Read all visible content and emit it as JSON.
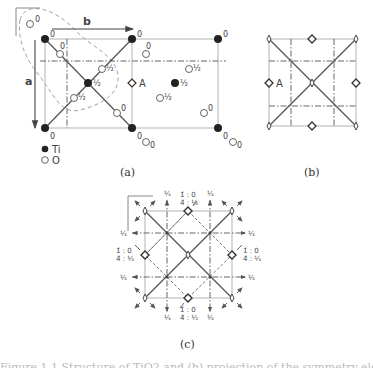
{
  "figure": {
    "panel_a": {
      "caption": "(a)",
      "axis_a_label": "a",
      "axis_b_label": "b",
      "symmetry_label": "A",
      "legend": [
        {
          "symbol": "filled-circle",
          "label": "Ti"
        },
        {
          "symbol": "open-circle",
          "label": "O"
        }
      ],
      "ti_atoms": [
        {
          "x": 45,
          "y": 39,
          "h": "0"
        },
        {
          "x": 132,
          "y": 39,
          "h": "0"
        },
        {
          "x": 218,
          "y": 39,
          "h": "0"
        },
        {
          "x": 45,
          "y": 128,
          "h": "0"
        },
        {
          "x": 132,
          "y": 128,
          "h": "0"
        },
        {
          "x": 218,
          "y": 128,
          "h": "0"
        },
        {
          "x": 88,
          "y": 83,
          "h": "½"
        },
        {
          "x": 175,
          "y": 83,
          "h": "½"
        }
      ],
      "o_atoms": [
        {
          "x": 30,
          "y": 24,
          "h": "0"
        },
        {
          "x": 60,
          "y": 54,
          "h": "0"
        },
        {
          "x": 102,
          "y": 69,
          "h": "½"
        },
        {
          "x": 74,
          "y": 98,
          "h": "½"
        },
        {
          "x": 117,
          "y": 113,
          "h": "0"
        },
        {
          "x": 146,
          "y": 54,
          "h": "0"
        },
        {
          "x": 189,
          "y": 69,
          "h": "½"
        },
        {
          "x": 160,
          "y": 98,
          "h": "½"
        },
        {
          "x": 204,
          "y": 113,
          "h": "0"
        },
        {
          "x": 146,
          "y": 142,
          "h": "0"
        },
        {
          "x": 233,
          "y": 142,
          "h": "0"
        }
      ]
    },
    "panel_b": {
      "caption": "(b)",
      "symmetry_label": "A"
    },
    "panel_c": {
      "caption": "(c)",
      "quarter_label": "¼",
      "site_label_top": "1̄ : 0",
      "site_label_bottom": "4̄ : ¼"
    },
    "clipped_caption_text": "Figure 1.1  Structure of TiO2 and (b) projection of the symmetry elements (c)"
  }
}
